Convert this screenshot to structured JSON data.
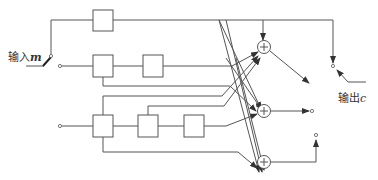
{
  "diagram": {
    "input_label": {
      "text": "输入",
      "var": "m"
    },
    "output_label": {
      "text": "输出",
      "var": "c"
    },
    "branches": [
      {
        "name": "branch-1",
        "registers": 1
      },
      {
        "name": "branch-2",
        "registers": 2
      },
      {
        "name": "branch-3",
        "registers": 3
      }
    ],
    "adders": [
      {
        "name": "adder-1",
        "symbol": "+"
      },
      {
        "name": "adder-2",
        "symbol": "+"
      },
      {
        "name": "adder-3",
        "symbol": "+"
      }
    ]
  }
}
